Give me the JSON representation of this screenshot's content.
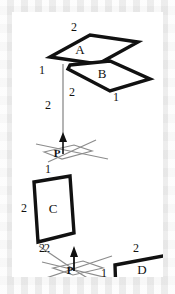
{
  "figure": {
    "background_color": "#f2f2f2",
    "canvas_color": "#ffffff",
    "stroke_color": "#111111",
    "thin_stroke_color": "#8c8c8c",
    "regions": [
      {
        "id": "region-a",
        "label": "A",
        "label_x": 68,
        "label_y": 42,
        "outline": "38,45 78,23 126,30 86,52",
        "dims": [
          {
            "text": "2",
            "x": 62,
            "y": 19
          }
        ]
      },
      {
        "id": "region-b",
        "label": "B",
        "label_x": 90,
        "label_y": 66,
        "outline": "58,53 98,49 138,67 98,79 56,57",
        "dims": [
          {
            "text": "1",
            "x": 30,
            "y": 62
          },
          {
            "text": "2",
            "x": 60,
            "y": 84
          },
          {
            "text": "1",
            "x": 104,
            "y": 89
          }
        ]
      },
      {
        "id": "region-c",
        "label": "C",
        "label_x": 41,
        "label_y": 201,
        "outline": "22,170 58,164 62,221 26,230",
        "dims": [
          {
            "text": "1",
            "x": 36,
            "y": 161
          },
          {
            "text": "2",
            "x": 12,
            "y": 200
          },
          {
            "text": "2",
            "x": 35,
            "y": 240
          }
        ]
      },
      {
        "id": "region-d",
        "label": "D",
        "label_x": 130,
        "label_y": 262,
        "outline": "103,253 156,243 157,272 104,281",
        "dims": [
          {
            "text": "2",
            "x": 124,
            "y": 240
          },
          {
            "text": "1",
            "x": 92,
            "y": 265
          }
        ]
      }
    ],
    "reference_planes": [
      {
        "id": "plane-p-upper",
        "label": "P",
        "label_x": 47,
        "label_y": 143,
        "plane_outline": "32,140 62,133 80,139 50,147",
        "axis_lines": [
          "24,132 96,147",
          "36,150 84,128"
        ],
        "normal_arrow": {
          "x1": 51,
          "y1": 142,
          "x2": 51,
          "y2": 124
        },
        "drop_line": {
          "x1": 51,
          "y1": 124,
          "x2": 51,
          "y2": 52
        },
        "drop_dim": {
          "text": "2",
          "x": 36,
          "y": 97
        }
      },
      {
        "id": "plane-p-lower",
        "label": "P",
        "label_x": 58,
        "label_y": 261,
        "plane_outline": "41,256 71,249 91,256 61,263",
        "axis_lines": [
          "30,250 104,268",
          "34,266 100,244"
        ],
        "normal_arrow": {
          "x1": 62,
          "y1": 259,
          "x2": 62,
          "y2": 238
        },
        "diagonal_left": "27,234 64,259",
        "diagonal_right": "64,259 102,282",
        "dims": [
          {
            "text": "2",
            "x": 30,
            "y": 240
          },
          {
            "text": "2",
            "x": 70,
            "y": 279
          }
        ]
      }
    ]
  }
}
